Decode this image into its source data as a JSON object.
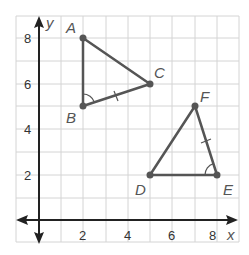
{
  "diagram": {
    "axes": {
      "x_label": "x",
      "y_label": "y"
    },
    "x_ticks": [
      "2",
      "4",
      "6",
      "8"
    ],
    "y_ticks": [
      "2",
      "4",
      "6",
      "8"
    ],
    "triangles": [
      {
        "name": "ABC",
        "vertices": [
          {
            "label": "A",
            "x": 2,
            "y": 8
          },
          {
            "label": "B",
            "x": 2,
            "y": 5
          },
          {
            "label": "C",
            "x": 5,
            "y": 6
          }
        ],
        "angle_mark": "B",
        "tick_mark_side": "BC"
      },
      {
        "name": "DEF",
        "vertices": [
          {
            "label": "D",
            "x": 5,
            "y": 2
          },
          {
            "label": "E",
            "x": 8,
            "y": 2
          },
          {
            "label": "F",
            "x": 7,
            "y": 5
          }
        ],
        "angle_mark": "E",
        "tick_mark_side": "EF"
      }
    ],
    "colors": {
      "grid": "#d4d4d4",
      "axis": "#222222",
      "triangle": "#555555"
    }
  }
}
